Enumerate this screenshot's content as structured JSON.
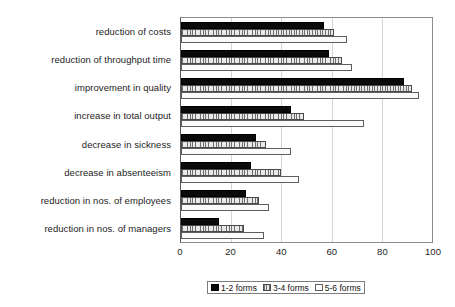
{
  "chart_data": {
    "type": "bar",
    "orientation": "horizontal",
    "title": "",
    "xlabel": "",
    "ylabel": "",
    "xlim": [
      0,
      100
    ],
    "xticks": [
      "0",
      "20",
      "40",
      "60",
      "80",
      "100"
    ],
    "grid": true,
    "grid_axis": "x",
    "legend_position": "bottom",
    "categories": [
      "reduction of costs",
      "reduction of throughput time",
      "improvement in quality",
      "increase in total output",
      "decrease in sickness",
      "decrease in absenteeism",
      "reduction in nos. of  employees",
      "reduction in nos. of managers"
    ],
    "series": [
      {
        "name": "1-2 forms",
        "color": "#0a0a0a",
        "values": [
          57,
          59,
          89,
          44,
          30,
          28,
          26,
          15
        ]
      },
      {
        "name": "3-4 forms",
        "color": "#d8d8d8",
        "values": [
          61,
          64,
          92,
          49,
          34,
          40,
          31,
          25
        ]
      },
      {
        "name": "5-6 forms",
        "color": "#ffffff",
        "values": [
          66,
          68,
          95,
          73,
          44,
          47,
          35,
          33
        ]
      }
    ]
  },
  "legend": {
    "items": [
      {
        "label": "1-2 forms"
      },
      {
        "label": "3-4 forms"
      },
      {
        "label": "5-6 forms"
      }
    ]
  }
}
